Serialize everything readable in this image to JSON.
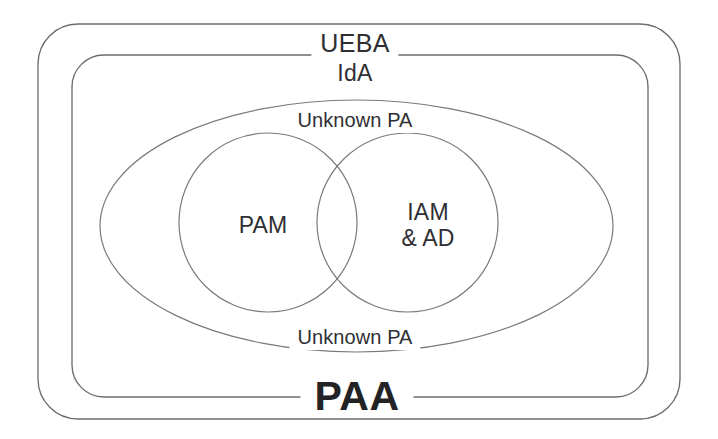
{
  "diagram": {
    "background_color": "#ffffff",
    "stroke_color": "#6d6d70",
    "text_color": "#2f2f33",
    "regions": [
      {
        "id": "ueba",
        "label": "UEBA",
        "shape": "rounded-rectangle",
        "level": 1
      },
      {
        "id": "ida",
        "label": "IdA",
        "shape": "rounded-rectangle",
        "level": 2
      },
      {
        "id": "paa",
        "label": "PAA",
        "shape": "rounded-rectangle-bottom-label",
        "level": 2
      },
      {
        "id": "unknown-pa-top",
        "label": "Unknown PA",
        "shape": "ellipse",
        "level": 3
      },
      {
        "id": "unknown-pa-bottom",
        "label": "Unknown PA",
        "shape": "ellipse",
        "level": 3
      },
      {
        "id": "pam",
        "label": "PAM",
        "shape": "circle",
        "level": 4
      },
      {
        "id": "iam-ad",
        "label": "IAM\n& AD",
        "label_line1": "IAM",
        "label_line2": "& AD",
        "shape": "circle",
        "level": 4
      }
    ]
  },
  "labels": {
    "ueba": "UEBA",
    "ida": "IdA",
    "unknown_pa_top": "Unknown PA",
    "unknown_pa_bottom": "Unknown PA",
    "pam": "PAM",
    "iam_line1": "IAM",
    "iam_line2": "& AD",
    "paa": "PAA"
  }
}
